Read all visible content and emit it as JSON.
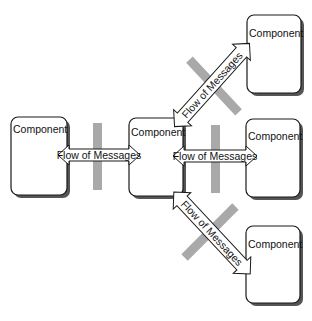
{
  "diagram": {
    "type": "component-message-flow",
    "components": [
      {
        "id": "left",
        "label": "Component",
        "x": 11,
        "y": 117,
        "w": 56,
        "h": 78
      },
      {
        "id": "center",
        "label": "Component",
        "x": 129,
        "y": 118,
        "w": 54,
        "h": 78
      },
      {
        "id": "top-right",
        "label": "Component",
        "x": 247,
        "y": 15,
        "w": 54,
        "h": 78
      },
      {
        "id": "middle-right",
        "label": "Component",
        "x": 246,
        "y": 119,
        "w": 54,
        "h": 78
      },
      {
        "id": "bottom-right",
        "label": "Component",
        "x": 246,
        "y": 226,
        "w": 54,
        "h": 77
      }
    ],
    "flows": [
      {
        "id": "left-center",
        "label": "Flow of Messages",
        "from": "left",
        "to": "center",
        "blocked": true
      },
      {
        "id": "center-top-right",
        "label": "Flow of Messages",
        "from": "center",
        "to": "top-right",
        "blocked": true
      },
      {
        "id": "center-middle-right",
        "label": "Flow of Messages",
        "from": "center",
        "to": "middle-right",
        "blocked": true
      },
      {
        "id": "center-bottom-right",
        "label": "Flow of Messages",
        "from": "center",
        "to": "bottom-right",
        "blocked": true
      }
    ],
    "colors": {
      "box_stroke": "#1a1a1a",
      "shadow": "#555555",
      "block_bar": "#a9a9a9",
      "background": "#ffffff"
    }
  }
}
